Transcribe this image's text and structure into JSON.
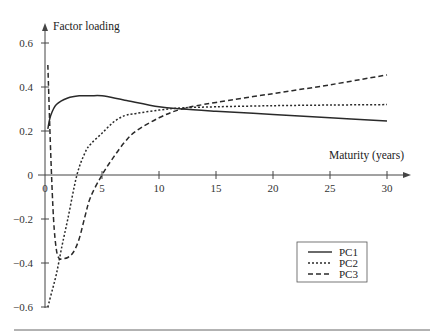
{
  "chart_data": {
    "type": "line",
    "title": "",
    "xlabel": "Maturity (years)",
    "ylabel": "Factor loading",
    "xlim": [
      0,
      32
    ],
    "ylim": [
      -0.6,
      0.65
    ],
    "xticks": [
      0,
      5,
      10,
      15,
      20,
      25,
      30
    ],
    "xtick_labels": [
      "0",
      "5",
      "10",
      "15",
      "20",
      "25",
      "30"
    ],
    "yticks": [
      0.6,
      0.4,
      0.2,
      0,
      -0.2,
      -0.4,
      -0.6
    ],
    "ytick_labels": [
      "0.6",
      "0.4",
      "0.2",
      "0",
      "−0.2",
      "−0.4",
      "−0.6"
    ],
    "grid": false,
    "legend_position": "lower right",
    "series": [
      {
        "name": "PC1",
        "style": "solid",
        "x": [
          0.25,
          0.5,
          1,
          2,
          3,
          4,
          5,
          7,
          10,
          12,
          15,
          20,
          25,
          30
        ],
        "values": [
          0.21,
          0.27,
          0.32,
          0.35,
          0.36,
          0.36,
          0.36,
          0.34,
          0.31,
          0.3,
          0.29,
          0.275,
          0.26,
          0.245
        ]
      },
      {
        "name": "PC2",
        "style": "dotted",
        "x": [
          0.25,
          0.5,
          1,
          1.5,
          2,
          2.8,
          3.5,
          4,
          5,
          6,
          7,
          8,
          10,
          12,
          15,
          20,
          25,
          30
        ],
        "values": [
          -0.6,
          -0.55,
          -0.45,
          -0.32,
          -0.2,
          0.0,
          0.1,
          0.14,
          0.19,
          0.24,
          0.27,
          0.28,
          0.295,
          0.305,
          0.31,
          0.315,
          0.318,
          0.32
        ]
      },
      {
        "name": "PC3",
        "style": "dashed",
        "x": [
          0.25,
          0.5,
          0.75,
          1,
          1.25,
          1.5,
          2,
          2.5,
          3,
          3.5,
          4,
          5,
          6,
          7,
          8,
          10,
          12,
          15,
          20,
          25,
          30
        ],
        "values": [
          0.5,
          0.1,
          -0.2,
          -0.34,
          -0.38,
          -0.38,
          -0.375,
          -0.35,
          -0.29,
          -0.19,
          -0.1,
          0.0,
          0.08,
          0.15,
          0.2,
          0.26,
          0.3,
          0.33,
          0.37,
          0.41,
          0.455
        ]
      }
    ]
  },
  "legend": {
    "items": [
      {
        "label": "PC1",
        "style": "solid"
      },
      {
        "label": "PC2",
        "style": "dotted"
      },
      {
        "label": "PC3",
        "style": "dashed"
      }
    ]
  },
  "colors": {
    "line": "#2a2a2a",
    "axis": "#444444",
    "rule": "#666666"
  }
}
